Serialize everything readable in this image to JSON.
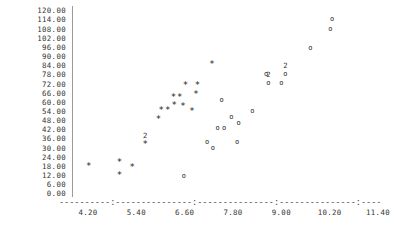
{
  "chart_data": {
    "type": "scatter",
    "title": "",
    "xlabel": "",
    "ylabel": "",
    "xlim": [
      4.2,
      11.4
    ],
    "ylim": [
      0.0,
      120.0
    ],
    "grid": false,
    "legend": "none",
    "y_ticks": [
      "120.00",
      "114.00",
      "108.00",
      "102.00",
      "96.00",
      "90.00",
      "84.00",
      "78.00",
      "72.00",
      "66.00",
      "60.00",
      "54.00",
      "48.00",
      "42.00",
      "36.00",
      "30.00",
      "24.00",
      "18.00",
      "12.00",
      "6.00",
      "0.00"
    ],
    "y_tick_values": [
      120,
      114,
      108,
      102,
      96,
      90,
      84,
      78,
      72,
      66,
      60,
      54,
      48,
      42,
      36,
      30,
      24,
      18,
      12,
      6,
      0
    ],
    "x_ticks": [
      "4.20",
      "5.40",
      "6.60",
      "7.80",
      "9.00",
      "10.20",
      "11.40"
    ],
    "x_tick_values": [
      4.2,
      5.4,
      6.6,
      7.8,
      9.0,
      10.2,
      11.4
    ],
    "series": [
      {
        "name": "star-series",
        "marker": "*",
        "points": [
          {
            "x": 4.22,
            "y": 18.5,
            "label": ""
          },
          {
            "x": 4.98,
            "y": 21.0,
            "label": ""
          },
          {
            "x": 4.98,
            "y": 12.5,
            "label": ""
          },
          {
            "x": 5.3,
            "y": 17.5,
            "label": ""
          },
          {
            "x": 5.62,
            "y": 33.0,
            "label": "2"
          },
          {
            "x": 5.95,
            "y": 49.5,
            "label": ""
          },
          {
            "x": 6.02,
            "y": 55.0,
            "label": ""
          },
          {
            "x": 6.18,
            "y": 55.0,
            "label": ""
          },
          {
            "x": 6.32,
            "y": 63.5,
            "label": ""
          },
          {
            "x": 6.48,
            "y": 63.5,
            "label": ""
          },
          {
            "x": 6.34,
            "y": 58.5,
            "label": ""
          },
          {
            "x": 6.56,
            "y": 58.0,
            "label": ""
          },
          {
            "x": 6.62,
            "y": 71.5,
            "label": ""
          },
          {
            "x": 6.92,
            "y": 71.5,
            "label": ""
          },
          {
            "x": 6.88,
            "y": 65.5,
            "label": ""
          },
          {
            "x": 6.78,
            "y": 54.5,
            "label": ""
          },
          {
            "x": 7.28,
            "y": 85.5,
            "label": ""
          }
        ]
      },
      {
        "name": "circle-series",
        "marker": "o",
        "points": [
          {
            "x": 6.58,
            "y": 12.0,
            "label": ""
          },
          {
            "x": 7.16,
            "y": 34.0,
            "label": ""
          },
          {
            "x": 7.3,
            "y": 30.0,
            "label": ""
          },
          {
            "x": 7.42,
            "y": 43.0,
            "label": ""
          },
          {
            "x": 7.58,
            "y": 43.0,
            "label": ""
          },
          {
            "x": 7.9,
            "y": 34.0,
            "label": ""
          },
          {
            "x": 7.76,
            "y": 50.5,
            "label": ""
          },
          {
            "x": 7.94,
            "y": 46.5,
            "label": ""
          },
          {
            "x": 7.52,
            "y": 61.5,
            "label": ""
          },
          {
            "x": 8.28,
            "y": 54.5,
            "label": ""
          },
          {
            "x": 8.68,
            "y": 72.5,
            "label": "2"
          },
          {
            "x": 8.62,
            "y": 78.5,
            "label": ""
          },
          {
            "x": 9.0,
            "y": 72.5,
            "label": ""
          },
          {
            "x": 9.1,
            "y": 78.5,
            "label": "2"
          },
          {
            "x": 9.72,
            "y": 96.0,
            "label": ""
          },
          {
            "x": 10.22,
            "y": 108.5,
            "label": ""
          },
          {
            "x": 10.26,
            "y": 114.5,
            "label": ""
          }
        ]
      }
    ]
  }
}
